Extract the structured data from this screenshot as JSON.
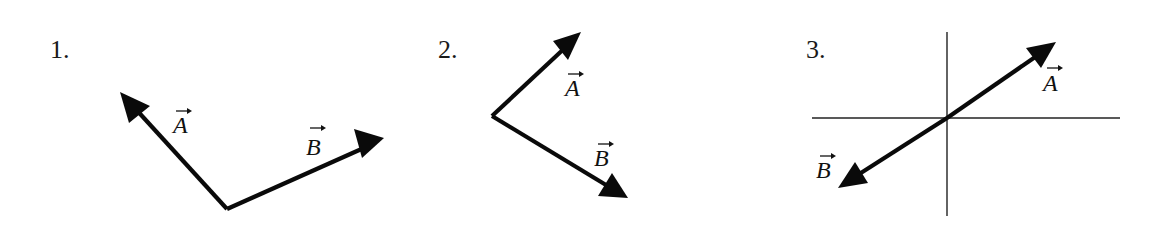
{
  "figure": {
    "panels": [
      {
        "number": "1.",
        "relation": "vectors share a common tail; A points up-left, B points up-right",
        "vectors": [
          {
            "name": "A",
            "label": "A",
            "has_arrow_accent": true
          },
          {
            "name": "B",
            "label": "B",
            "has_arrow_accent": true
          }
        ]
      },
      {
        "number": "2.",
        "relation": "vectors share a common tail; A points up-right, B points down-right",
        "vectors": [
          {
            "name": "A",
            "label": "A",
            "has_arrow_accent": true
          },
          {
            "name": "B",
            "label": "B",
            "has_arrow_accent": true
          }
        ]
      },
      {
        "number": "3.",
        "relation": "vectors start at the origin of coordinate axes and point in opposite directions (A up-right, B down-left)",
        "has_axes": true,
        "vectors": [
          {
            "name": "A",
            "label": "A",
            "has_arrow_accent": true
          },
          {
            "name": "B",
            "label": "B",
            "has_arrow_accent": true
          }
        ]
      }
    ],
    "colors": {
      "ink": "#0a0a0a",
      "background": "#ffffff"
    }
  }
}
